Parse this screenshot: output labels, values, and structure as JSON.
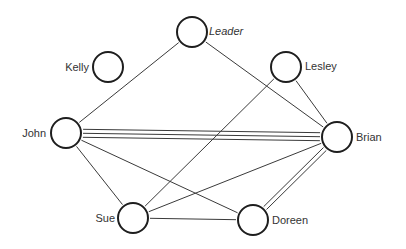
{
  "diagram": {
    "type": "sociogram",
    "nodes": [
      {
        "id": "leader",
        "label": "Leader",
        "x": 192,
        "y": 32,
        "r": 15,
        "label_x": 209,
        "label_y": 35,
        "anchor": "start",
        "italic": true
      },
      {
        "id": "kelly",
        "label": "Kelly",
        "x": 108,
        "y": 67,
        "r": 15,
        "label_x": 89,
        "label_y": 71,
        "anchor": "end",
        "italic": false
      },
      {
        "id": "lesley",
        "label": "Lesley",
        "x": 286,
        "y": 67,
        "r": 15,
        "label_x": 305,
        "label_y": 70,
        "anchor": "start",
        "italic": false
      },
      {
        "id": "john",
        "label": "John",
        "x": 66,
        "y": 133,
        "r": 15,
        "label_x": 46,
        "label_y": 137,
        "anchor": "end",
        "italic": false
      },
      {
        "id": "brian",
        "label": "Brian",
        "x": 337,
        "y": 137,
        "r": 15,
        "label_x": 356,
        "label_y": 141,
        "anchor": "start",
        "italic": false
      },
      {
        "id": "sue",
        "label": "Sue",
        "x": 133,
        "y": 218,
        "r": 15,
        "label_x": 115,
        "label_y": 222,
        "anchor": "end",
        "italic": false
      },
      {
        "id": "doreen",
        "label": "Doreen",
        "x": 253,
        "y": 220,
        "r": 15,
        "label_x": 272,
        "label_y": 224,
        "anchor": "start",
        "italic": false
      }
    ],
    "edges": [
      {
        "from": "leader",
        "to": "john",
        "count": 1
      },
      {
        "from": "leader",
        "to": "brian",
        "count": 1
      },
      {
        "from": "lesley",
        "to": "sue",
        "count": 1
      },
      {
        "from": "lesley",
        "to": "brian",
        "count": 1
      },
      {
        "from": "john",
        "to": "brian",
        "count": 3
      },
      {
        "from": "john",
        "to": "sue",
        "count": 1
      },
      {
        "from": "john",
        "to": "doreen",
        "count": 1
      },
      {
        "from": "sue",
        "to": "brian",
        "count": 1
      },
      {
        "from": "sue",
        "to": "doreen",
        "count": 1
      },
      {
        "from": "brian",
        "to": "doreen",
        "count": 2
      }
    ]
  }
}
